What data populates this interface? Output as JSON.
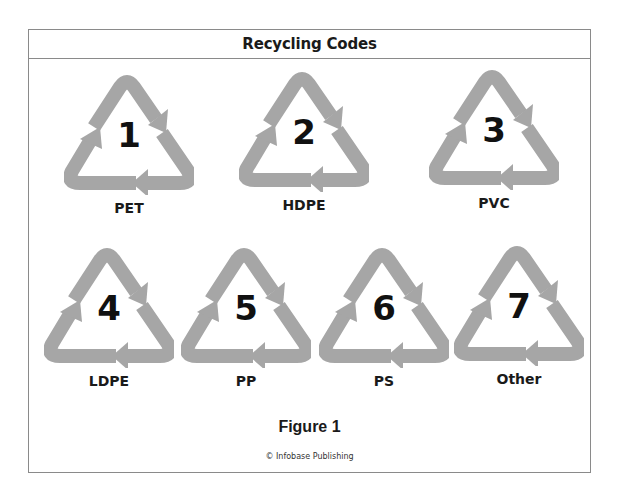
{
  "header": {
    "title": "Recycling Codes"
  },
  "symbol_color": "#a6a6a6",
  "codes": [
    {
      "number": "1",
      "label": "PET"
    },
    {
      "number": "2",
      "label": "HDPE"
    },
    {
      "number": "3",
      "label": "PVC"
    },
    {
      "number": "4",
      "label": "LDPE"
    },
    {
      "number": "5",
      "label": "PP"
    },
    {
      "number": "6",
      "label": "PS"
    },
    {
      "number": "7",
      "label": "Other"
    }
  ],
  "footer": {
    "figure_label": "Figure 1",
    "credit": "© Infobase Publishing"
  }
}
